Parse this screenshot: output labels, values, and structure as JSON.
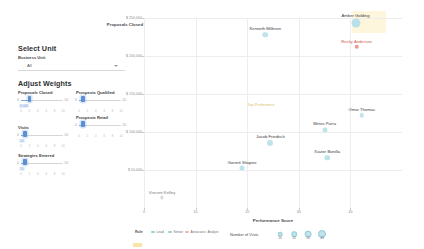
{
  "sidebar": {
    "select_unit": {
      "title": "Select Unit",
      "field_label": "Business Unit",
      "selected_value": "All",
      "caret_icon": "chevron-down-icon"
    },
    "adjust_weights": {
      "title": "Adjust Weights",
      "sliders": [
        {
          "name": "Proposals Closed",
          "min": "0",
          "max": "10",
          "value": "2",
          "readout": "0.000",
          "ticks": [
            "0",
            "2",
            "4",
            "6",
            "8",
            "10"
          ],
          "percent": 20
        },
        {
          "name": "Prospects Qualified",
          "min": "0",
          "max": "10",
          "value": "1",
          "readout": "",
          "ticks": [
            "0",
            "2",
            "4",
            "6",
            "8",
            "10"
          ],
          "percent": 10
        },
        {
          "name": "Visits",
          "min": "0",
          "max": "10",
          "value": "1",
          "readout": "10",
          "ticks": [
            "0",
            "2",
            "4",
            "6",
            "8",
            "10"
          ],
          "percent": 10
        },
        {
          "name": "Prospects Retail",
          "min": "0",
          "max": "10",
          "value": "1",
          "readout": "",
          "ticks": [
            "0",
            "2",
            "4",
            "6",
            "8",
            "10"
          ],
          "percent": 10
        },
        {
          "name": "Strategies Entered",
          "min": "0",
          "max": "10",
          "value": "1",
          "readout": "10",
          "ticks": [
            "0",
            "2",
            "4",
            "6",
            "8",
            "10"
          ],
          "percent": 10
        }
      ]
    }
  },
  "chart_data": {
    "type": "scatter",
    "title": "",
    "xlabel": "Performance Score",
    "ylabel": "Proposals Closed",
    "xlim": [
      0,
      50
    ],
    "ylim": [
      0,
      250000
    ],
    "grid": true,
    "x_ticks": [
      "0",
      "10",
      "20",
      "30",
      "40"
    ],
    "y_ticks": [
      "$ 250,000",
      "$ 200,000",
      "$ 150,000",
      "$ 100,000",
      "$ 50,000"
    ],
    "y_tick_values": [
      250000,
      200000,
      150000,
      100000,
      50000
    ],
    "size_legend": {
      "title": "Number of Visits",
      "values": [
        "10",
        "20",
        "30",
        "40"
      ]
    },
    "left_legend": {
      "title": "Role",
      "items": [
        {
          "label": "Lead",
          "color": "#9ecfda"
        },
        {
          "label": "Senior",
          "color": "#9ecfda"
        },
        {
          "label": "Associate",
          "color": "#e7b8b0"
        },
        {
          "label": "Analyst",
          "color": "#cfcfcf"
        }
      ]
    },
    "annotation": "Top Performers",
    "points": [
      {
        "name": "Amber Golding",
        "x": 41.0,
        "y": 243000,
        "size": 9.0,
        "color": "#b9e0e8",
        "label_color": "#3a3a3a"
      },
      {
        "name": "Kenneth Milleron",
        "x": 23.5,
        "y": 228000,
        "size": 5.5,
        "color": "#bfe3ea",
        "label_color": "#3a3a3a"
      },
      {
        "name": "Rocky Anderson",
        "x": 41.2,
        "y": 212000,
        "size": 4.5,
        "color": "#e89b8e",
        "label_color": "#d2584a"
      },
      {
        "name": "Omar Thomas",
        "x": 42.2,
        "y": 122000,
        "size": 4.5,
        "color": "#c3e4ec",
        "label_color": "#3a3a3a"
      },
      {
        "name": "Mirtes Parra",
        "x": 35.0,
        "y": 103000,
        "size": 5.0,
        "color": "#bfe3ea",
        "label_color": "#3a3a3a"
      },
      {
        "name": "Jacob Friedrich",
        "x": 24.5,
        "y": 85000,
        "size": 6.0,
        "color": "#bfe3ea",
        "label_color": "#3a3a3a"
      },
      {
        "name": "Xavier Bonilla",
        "x": 35.5,
        "y": 66000,
        "size": 5.5,
        "color": "#bfe3ea",
        "label_color": "#3a3a3a"
      },
      {
        "name": "Garrett Shapiro",
        "x": 19.0,
        "y": 52000,
        "size": 5.0,
        "color": "#bfe3ea",
        "label_color": "#3a3a3a"
      },
      {
        "name": "Vincent Kelley",
        "x": 3.5,
        "y": 14000,
        "size": 3.2,
        "color": "#d9d9d9",
        "label_color": "#7a7a7a"
      }
    ]
  }
}
